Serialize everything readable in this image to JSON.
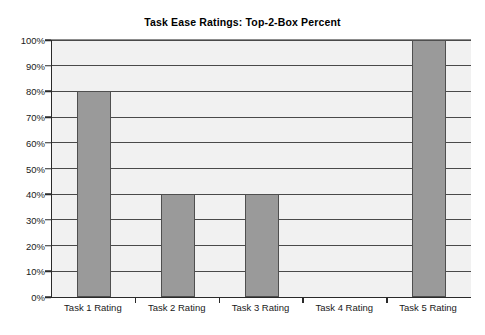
{
  "chart_data": {
    "type": "bar",
    "title": "Task Ease Ratings: Top-2-Box Percent",
    "xlabel": "",
    "ylabel": "",
    "categories": [
      "Task 1 Rating",
      "Task 2 Rating",
      "Task 3 Rating",
      "Task 4 Rating",
      "Task 5 Rating"
    ],
    "values": [
      80,
      40,
      40,
      0,
      100
    ],
    "value_unit": "%",
    "ylim": [
      0,
      100
    ],
    "ytick_step": 10,
    "ytick_labels": [
      "0%",
      "10%",
      "20%",
      "30%",
      "40%",
      "50%",
      "60%",
      "70%",
      "80%",
      "90%",
      "100%"
    ],
    "ytick_values": [
      0,
      10,
      20,
      30,
      40,
      50,
      60,
      70,
      80,
      90,
      100
    ],
    "grid": true,
    "grid_axis": "y",
    "legend": false,
    "legend_position": "none",
    "series": [
      {
        "name": "Top-2-Box Percent",
        "values": [
          80,
          40,
          40,
          0,
          100
        ]
      }
    ],
    "colors": {
      "bar_fill": "#9a9a9a",
      "bar_border": "#4f4f4f",
      "plot_background": "#f1f1f1",
      "gridline": "#4a4a4a",
      "axis": "#2a2a2a",
      "text": "#1a1a1a",
      "page_background": "#ffffff"
    }
  }
}
